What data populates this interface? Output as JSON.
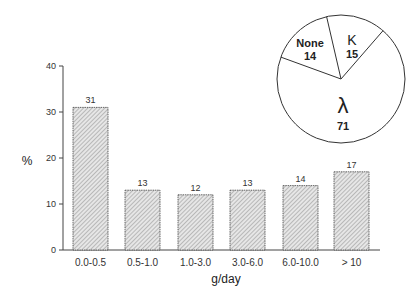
{
  "chart_data": [
    {
      "type": "bar",
      "title": "",
      "xlabel": "g/day",
      "ylabel": "%",
      "ylim": [
        0,
        40
      ],
      "yticks": [
        0,
        10,
        20,
        30,
        40
      ],
      "grid": false,
      "categories": [
        "0.0-0.5",
        "0.5-1.0",
        "1.0-3.0",
        "3.0-6.0",
        "6.0-10.0",
        "> 10"
      ],
      "values": [
        31,
        13,
        12,
        13,
        14,
        17
      ],
      "data_labels": [
        "31",
        "13",
        "12",
        "13",
        "14",
        "17"
      ],
      "bar_fill": "hatched gray"
    },
    {
      "type": "pie",
      "title": "",
      "labels": [
        "λ",
        "None",
        "K"
      ],
      "values": [
        71,
        14,
        15
      ],
      "data_labels": [
        "71",
        "14",
        "15"
      ],
      "position": "inset top-right"
    }
  ],
  "colors": {
    "bar_fill": "#d9d9d9",
    "hatch": "#888888",
    "stroke": "#333333",
    "pie_fill": "#ffffff"
  }
}
